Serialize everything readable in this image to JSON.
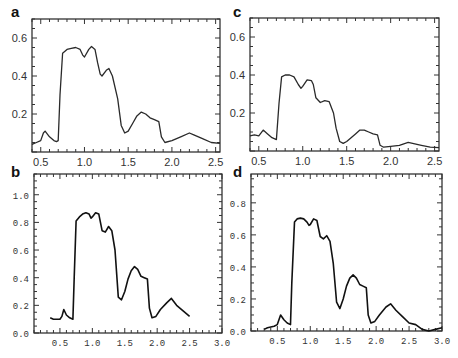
{
  "chart_data": [
    {
      "id": "a",
      "label": "a",
      "type": "line",
      "title": "",
      "xlabel": "",
      "ylabel": "",
      "xlim": [
        0.4,
        2.55
      ],
      "ylim": [
        0,
        0.7
      ],
      "xticks": [
        "0.5",
        "1.0",
        "1.5",
        "2.0",
        "2.5"
      ],
      "yticks": [
        "0.2",
        "0.4",
        "0.6"
      ],
      "x": [
        0.4,
        0.45,
        0.5,
        0.53,
        0.55,
        0.6,
        0.65,
        0.68,
        0.7,
        0.72,
        0.75,
        0.8,
        0.85,
        0.9,
        0.95,
        0.98,
        1.0,
        1.05,
        1.08,
        1.12,
        1.15,
        1.18,
        1.2,
        1.25,
        1.28,
        1.32,
        1.38,
        1.42,
        1.46,
        1.5,
        1.55,
        1.6,
        1.65,
        1.7,
        1.75,
        1.8,
        1.85,
        1.88,
        1.92,
        2.0,
        2.1,
        2.2,
        2.25,
        2.35,
        2.45,
        2.55
      ],
      "values": [
        0.04,
        0.05,
        0.06,
        0.1,
        0.11,
        0.08,
        0.06,
        0.055,
        0.06,
        0.3,
        0.52,
        0.54,
        0.545,
        0.55,
        0.54,
        0.51,
        0.5,
        0.54,
        0.555,
        0.54,
        0.47,
        0.41,
        0.4,
        0.43,
        0.44,
        0.4,
        0.28,
        0.14,
        0.1,
        0.11,
        0.15,
        0.19,
        0.21,
        0.2,
        0.18,
        0.17,
        0.16,
        0.08,
        0.05,
        0.06,
        0.08,
        0.1,
        0.09,
        0.07,
        0.05,
        0.045
      ]
    },
    {
      "id": "b",
      "label": "b",
      "type": "line",
      "title": "",
      "xlabel": "",
      "ylabel": "",
      "xlim": [
        0.1,
        3.0
      ],
      "ylim": [
        0.0,
        1.15
      ],
      "xticks": [
        "0.5",
        "1.0",
        "1.5",
        "2.0",
        "2.5",
        "3.0"
      ],
      "yticks": [
        "0.0",
        "0.2",
        "0.4",
        "0.6",
        "0.8",
        "1.0"
      ],
      "x": [
        0.35,
        0.4,
        0.5,
        0.53,
        0.56,
        0.6,
        0.65,
        0.7,
        0.72,
        0.75,
        0.8,
        0.85,
        0.9,
        0.95,
        0.98,
        1.0,
        1.05,
        1.1,
        1.15,
        1.2,
        1.25,
        1.3,
        1.35,
        1.4,
        1.45,
        1.5,
        1.55,
        1.6,
        1.65,
        1.7,
        1.75,
        1.8,
        1.85,
        1.88,
        1.92,
        1.98,
        2.05,
        2.15,
        2.22,
        2.3,
        2.4,
        2.5
      ],
      "values": [
        0.11,
        0.1,
        0.1,
        0.12,
        0.17,
        0.13,
        0.11,
        0.1,
        0.4,
        0.81,
        0.84,
        0.86,
        0.87,
        0.86,
        0.83,
        0.84,
        0.87,
        0.86,
        0.74,
        0.73,
        0.77,
        0.74,
        0.6,
        0.26,
        0.24,
        0.3,
        0.39,
        0.45,
        0.48,
        0.46,
        0.41,
        0.4,
        0.39,
        0.18,
        0.11,
        0.12,
        0.17,
        0.22,
        0.25,
        0.2,
        0.16,
        0.12
      ]
    },
    {
      "id": "c",
      "label": "c",
      "type": "line",
      "title": "",
      "xlabel": "",
      "ylabel": "",
      "xlim": [
        0.4,
        2.55
      ],
      "ylim": [
        0,
        0.7
      ],
      "xticks": [
        "0.5",
        "1.0",
        "1.5",
        "2.0",
        "2.5"
      ],
      "yticks": [
        "0.2",
        "0.4",
        "0.6"
      ],
      "x": [
        0.4,
        0.45,
        0.5,
        0.55,
        0.6,
        0.65,
        0.7,
        0.73,
        0.76,
        0.8,
        0.85,
        0.9,
        0.95,
        0.98,
        1.0,
        1.05,
        1.1,
        1.12,
        1.15,
        1.2,
        1.25,
        1.3,
        1.35,
        1.38,
        1.42,
        1.46,
        1.5,
        1.55,
        1.6,
        1.65,
        1.7,
        1.75,
        1.8,
        1.85,
        1.88,
        1.92,
        2.0,
        2.1,
        2.2,
        2.25,
        2.35,
        2.45,
        2.55
      ],
      "values": [
        0.08,
        0.085,
        0.08,
        0.11,
        0.09,
        0.07,
        0.06,
        0.25,
        0.39,
        0.4,
        0.4,
        0.39,
        0.35,
        0.33,
        0.34,
        0.375,
        0.37,
        0.35,
        0.28,
        0.255,
        0.265,
        0.26,
        0.2,
        0.12,
        0.05,
        0.04,
        0.05,
        0.07,
        0.09,
        0.11,
        0.11,
        0.1,
        0.09,
        0.085,
        0.03,
        0.02,
        0.025,
        0.03,
        0.045,
        0.04,
        0.03,
        0.02,
        0.018
      ]
    },
    {
      "id": "d",
      "label": "d",
      "type": "line",
      "title": "",
      "xlabel": "",
      "ylabel": "",
      "xlim": [
        0.1,
        3.0
      ],
      "ylim": [
        0.0,
        0.98
      ],
      "xticks": [
        "0.5",
        "1.0",
        "1.5",
        "2.0",
        "2.5",
        "3.0"
      ],
      "yticks": [
        "0.0",
        "0.2",
        "0.4",
        "0.6",
        "0.8"
      ],
      "x": [
        0.3,
        0.35,
        0.45,
        0.5,
        0.55,
        0.6,
        0.65,
        0.7,
        0.72,
        0.76,
        0.8,
        0.85,
        0.9,
        0.95,
        0.98,
        1.0,
        1.05,
        1.1,
        1.15,
        1.2,
        1.25,
        1.3,
        1.35,
        1.4,
        1.45,
        1.5,
        1.55,
        1.6,
        1.65,
        1.7,
        1.75,
        1.8,
        1.85,
        1.88,
        1.92,
        1.98,
        2.05,
        2.15,
        2.22,
        2.3,
        2.4,
        2.5,
        2.6,
        2.7,
        2.8,
        2.9,
        3.0
      ],
      "values": [
        0.01,
        0.02,
        0.03,
        0.04,
        0.1,
        0.07,
        0.05,
        0.04,
        0.3,
        0.68,
        0.7,
        0.705,
        0.7,
        0.68,
        0.66,
        0.665,
        0.7,
        0.69,
        0.59,
        0.575,
        0.595,
        0.56,
        0.42,
        0.18,
        0.14,
        0.2,
        0.28,
        0.33,
        0.35,
        0.33,
        0.29,
        0.28,
        0.27,
        0.1,
        0.05,
        0.06,
        0.1,
        0.15,
        0.17,
        0.13,
        0.09,
        0.05,
        0.04,
        0.01,
        0.0,
        0.01,
        0.02
      ]
    }
  ]
}
